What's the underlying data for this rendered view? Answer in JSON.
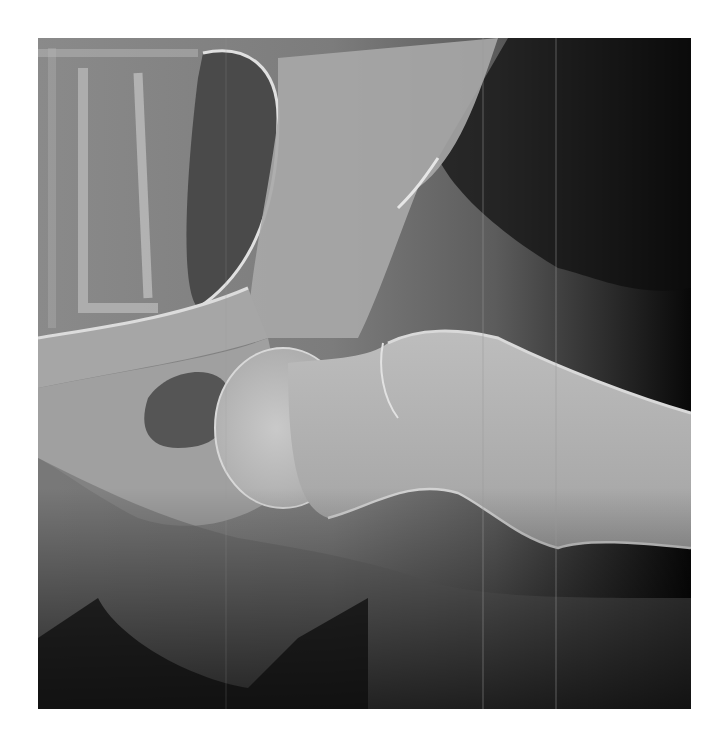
{
  "image": {
    "kind": "radiograph",
    "description": "Lateral hip X-ray showing pelvis, acetabulum, femoral head, neck and proximal femur shaft",
    "alt": "Hip radiograph",
    "colors": {
      "background": "#ffffff",
      "soft_tissue": "#7a7a7a",
      "bone": "#cfcfcf",
      "dark_area": "#0a0a0a"
    }
  }
}
